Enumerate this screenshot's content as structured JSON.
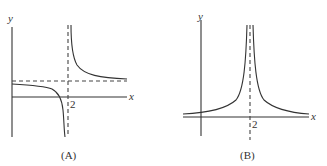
{
  "panels": [
    {
      "id": "A",
      "caption": "(A)",
      "x_axis_label": "x",
      "y_axis_label": "y",
      "tick_label": "2",
      "description": "Rational function with vertical asymptote at x=2 and horizontal asymptote above the x-axis; left branch descends to -infinity, right branch descends from +infinity"
    },
    {
      "id": "B",
      "caption": "(B)",
      "x_axis_label": "x",
      "y_axis_label": "y",
      "tick_label": "2",
      "description": "Function symmetric about vertical asymptote at x=2, both branches rise to +infinity, horizontal asymptote near the x-axis"
    }
  ],
  "colors": {
    "ink": "#333333",
    "background": "#ffffff"
  }
}
